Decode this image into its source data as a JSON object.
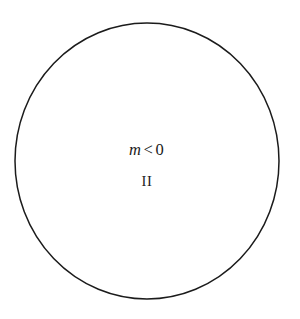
{
  "figure": {
    "background_color": "#ffffff",
    "stroke_color": "#1b1b1b",
    "text_color": "#1b1b1b",
    "shape": {
      "name": "circle",
      "center_x": 147,
      "center_y": 161,
      "radius_x": 132,
      "radius_y": 138,
      "stroke_width": 1.5,
      "fill": "none"
    },
    "labels": {
      "inequality": {
        "variable": "m",
        "operator": "<",
        "value": "0",
        "full_text": "m < 0"
      },
      "region": "II"
    }
  }
}
